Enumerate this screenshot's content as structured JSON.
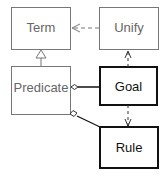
{
  "diagram": {
    "type": "UML class diagram",
    "classes": [
      {
        "id": "term",
        "label": "Term",
        "emphasis": false
      },
      {
        "id": "unify",
        "label": "Unify",
        "emphasis": false
      },
      {
        "id": "predicate",
        "label": "Predicate",
        "emphasis": false
      },
      {
        "id": "goal",
        "label": "Goal",
        "emphasis": true
      },
      {
        "id": "rule",
        "label": "Rule",
        "emphasis": true
      }
    ],
    "relations": [
      {
        "from": "unify",
        "to": "term",
        "kind": "dependency"
      },
      {
        "from": "predicate",
        "to": "term",
        "kind": "generalization"
      },
      {
        "from": "goal",
        "to": "unify",
        "kind": "dependency"
      },
      {
        "from": "predicate",
        "to": "goal",
        "kind": "aggregation"
      },
      {
        "from": "predicate",
        "to": "rule",
        "kind": "aggregation"
      },
      {
        "from": "goal",
        "to": "rule",
        "kind": "dependency"
      }
    ],
    "colors": {
      "light_stroke": "#777777",
      "bold_stroke": "#111111",
      "light_text": "#666666",
      "bold_text": "#111111",
      "background": "#ffffff"
    }
  }
}
